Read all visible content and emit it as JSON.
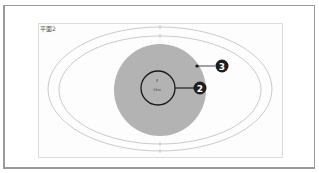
{
  "panel": {
    "label": "平面2"
  },
  "diagram": {
    "center_label": "15m",
    "callouts": [
      {
        "number": "2",
        "target": "inner-circle"
      },
      {
        "number": "3",
        "target": "gray-disk"
      }
    ]
  },
  "colors": {
    "frame": "#9a9a9a",
    "ellipse_stroke": "#c4c4c4",
    "disk_fill": "#b3b3b3",
    "circle_stroke": "#1a1a1a",
    "badge_fill": "#1e1e1e",
    "badge_text": "#ffffff"
  }
}
